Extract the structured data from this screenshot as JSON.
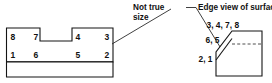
{
  "diagram": {
    "annotations": {
      "not_true_size": "Not true size",
      "not_true_size_line1": "Not true",
      "not_true_size_line2": "size",
      "edge_view": "Edge view of surface"
    },
    "top_view": {
      "name": "top-view-figure",
      "vertex_labels": {
        "upper_left": "8",
        "upper_inner_left": "7",
        "upper_inner_right": "4",
        "upper_right": "3",
        "lower_left": "1",
        "lower_inner_left": "6",
        "lower_inner_right": "5",
        "lower_right": "2"
      },
      "vertex_order": [
        "8",
        "7",
        "4",
        "3",
        "1",
        "6",
        "5",
        "2"
      ]
    },
    "edge_view": {
      "name": "edge-view-figure",
      "point_labels": {
        "top_group": "3, 4, 7, 8",
        "mid_group": "6, 5",
        "bottom_group": "2, 1"
      },
      "point_groups": [
        {
          "label": "3, 4, 7, 8",
          "points": [
            3,
            4,
            7,
            8
          ]
        },
        {
          "label": "6, 5",
          "points": [
            6,
            5
          ]
        },
        {
          "label": "2, 1",
          "points": [
            2,
            1
          ]
        }
      ]
    },
    "colors": {
      "line": "#141414",
      "hidden_line": "#3a3a3a",
      "leader": "#2a2a2a",
      "background": "#ffffff",
      "text": "#111111"
    }
  }
}
